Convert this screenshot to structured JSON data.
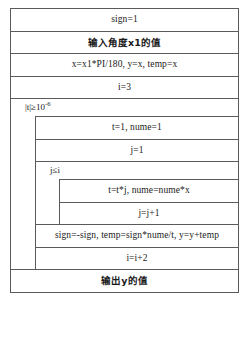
{
  "diagram": {
    "type": "nassi-shneiderman-flowchart",
    "border_color": "#5a5a5a",
    "background": "#ffffff",
    "blocks": [
      {
        "kind": "process",
        "text": "sign=1"
      },
      {
        "kind": "process",
        "text": "输入角度x1的值",
        "script": "chinese"
      },
      {
        "kind": "process",
        "text": "x=x1*PI/180, y=x, temp=x"
      },
      {
        "kind": "process",
        "text": "i=3"
      },
      {
        "kind": "loop",
        "condition_prefix": "|t|≥10",
        "condition_exponent": "-6",
        "condition_full": "|t|≥10-6",
        "body": [
          {
            "kind": "process",
            "text": "t=1, nume=1"
          },
          {
            "kind": "process",
            "text": "j=1"
          },
          {
            "kind": "loop",
            "condition_prefix": "j≤i",
            "condition_exponent": "",
            "condition_full": "j≤i",
            "body": [
              {
                "kind": "process",
                "text": "t=t*j, nume=nume*x"
              },
              {
                "kind": "process",
                "text": "j=j+1"
              }
            ]
          },
          {
            "kind": "process",
            "text": "sign=-sign, temp=sign*nume/t, y=y+temp"
          },
          {
            "kind": "process",
            "text": "i=i+2"
          }
        ]
      },
      {
        "kind": "process",
        "text": "输出y的值",
        "script": "chinese"
      }
    ]
  }
}
